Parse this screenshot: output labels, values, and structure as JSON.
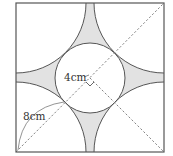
{
  "diagram": {
    "type": "geometry-figure",
    "labels": {
      "radius_label": "4cm",
      "corner_arc_label": "8cm"
    },
    "elements": {
      "square": true,
      "inner_circle": true,
      "corner_arcs": 4,
      "shaded_regions": 4,
      "dashed_diagonals": 2,
      "right_angle_mark": true
    },
    "colors": {
      "stroke": "#555555",
      "shade": "#e2e2e2",
      "dashed": "#777777",
      "text": "#333333"
    }
  }
}
